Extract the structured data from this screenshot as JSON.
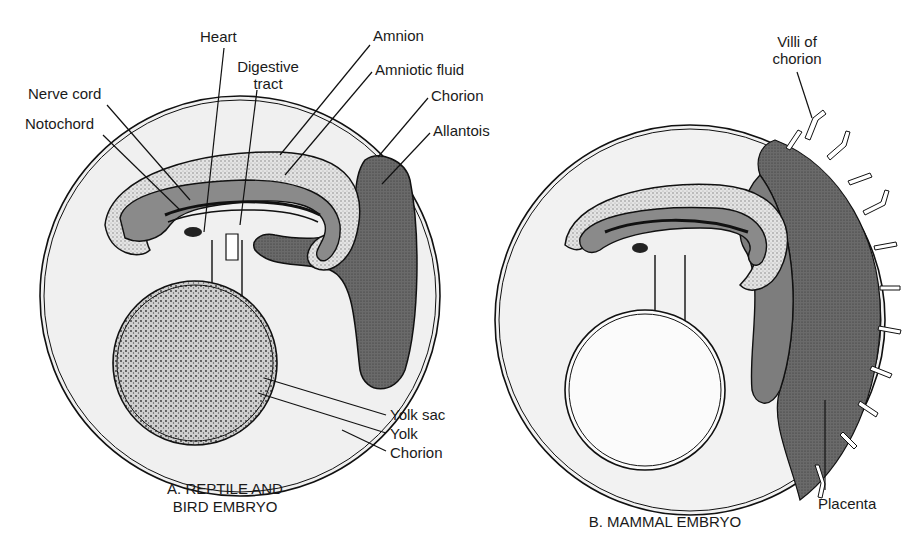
{
  "panel_a": {
    "caption_line1": "A. REPTILE AND",
    "caption_line2": "BIRD EMBRYO",
    "labels": {
      "heart": "Heart",
      "digestive_line1": "Digestive",
      "digestive_line2": "tract",
      "nerve_cord": "Nerve cord",
      "notochord": "Notochord",
      "amnion": "Amnion",
      "amniotic_fluid": "Amniotic fluid",
      "chorion_top": "Chorion",
      "allantois": "Allantois",
      "yolk_sac": "Yolk sac",
      "yolk": "Yolk",
      "chorion_bottom": "Chorion"
    }
  },
  "panel_b": {
    "caption": "B. MAMMAL EMBRYO",
    "labels": {
      "villi_line1": "Villi of",
      "villi_line2": "chorion",
      "placenta": "Placenta"
    }
  },
  "colors": {
    "outline": "#111111",
    "chorion_fill": "#efefef",
    "amnion_fill": "#d6d6d6",
    "allantois_fill": "#6e6e6e",
    "yolk_fill": "#bdbdbd",
    "placenta_fill": "#7a7a7a"
  }
}
